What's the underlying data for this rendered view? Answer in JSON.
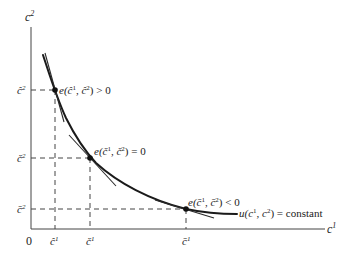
{
  "diagram": {
    "axes": {
      "y_label_base": "c",
      "y_label_sup": "2",
      "x_label_base": "c",
      "x_label_sup": "1",
      "origin_label": "0"
    },
    "curve_label": {
      "prefix": "u(c",
      "sup1": "1",
      "middle": ", c",
      "sup2": "2",
      "suffix": ") = constant"
    },
    "points": [
      {
        "name": "hat-point",
        "label_prefix": "e(",
        "c1": "ĉ",
        "sup1": "1",
        "sep": ", ",
        "c2": "ĉ",
        "sup2": "2",
        "label_suffix": ") > 0",
        "x_tick": "ĉ",
        "x_tick_sup": "1",
        "y_tick": "ĉ",
        "y_tick_sup": "2"
      },
      {
        "name": "check-point",
        "label_prefix": "e(",
        "c1": "č",
        "sup1": "1",
        "sep": ", ",
        "c2": "č",
        "sup2": "2",
        "label_suffix": ") = 0",
        "x_tick": "č",
        "x_tick_sup": "1",
        "y_tick": "č",
        "y_tick_sup": "2"
      },
      {
        "name": "bar-point",
        "label_prefix": "e(",
        "c1": "c̄",
        "sup1": "1",
        "sep": ", ",
        "c2": "c̄",
        "sup2": "2",
        "label_suffix": ") < 0",
        "x_tick": "c̄",
        "x_tick_sup": "1",
        "y_tick": "c̄",
        "y_tick_sup": "2"
      }
    ]
  }
}
